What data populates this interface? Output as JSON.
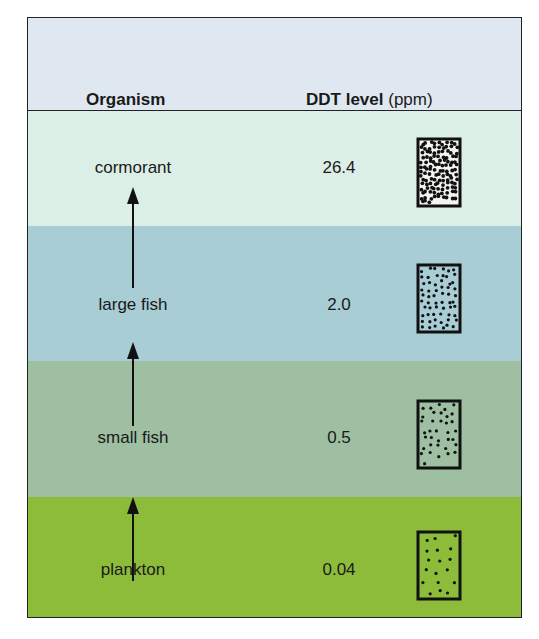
{
  "header": {
    "organism_label": "Organism",
    "ddt_label": "DDT level",
    "ddt_unit": "(ppm)"
  },
  "rows": [
    {
      "organism": "cormorant",
      "ddt_ppm": "26.4",
      "color": "#dcefe7",
      "dot_density": "very high"
    },
    {
      "organism": "large fish",
      "ddt_ppm": "2.0",
      "color": "#a9cdd5",
      "dot_density": "high"
    },
    {
      "organism": "small fish",
      "ddt_ppm": "0.5",
      "color": "#9ebfa2",
      "dot_density": "medium"
    },
    {
      "organism": "plankton",
      "ddt_ppm": "0.04",
      "color": "#8dbc3b",
      "dot_density": "low"
    }
  ],
  "arrows": [
    "plankton to small fish",
    "small fish to large fish",
    "large fish to cormorant"
  ]
}
